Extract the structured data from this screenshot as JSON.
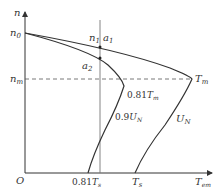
{
  "diagram": {
    "type": "motor mechanical characteristic (speed vs torque)",
    "axes": {
      "y_axis_label": "n",
      "x_axis_label": "T",
      "x_axis_label_sub": "em",
      "origin_label": "O"
    },
    "y_ticks": [
      {
        "label": "n",
        "sub": "0"
      },
      {
        "label": "n",
        "sub": "m"
      }
    ],
    "x_ticks": [
      {
        "prefix": "0.81",
        "label": "T",
        "sub": "s"
      },
      {
        "prefix": "",
        "label": "T",
        "sub": "s"
      }
    ],
    "points": [
      {
        "label": "n",
        "sub": "1"
      },
      {
        "label": "a",
        "sub": "1"
      },
      {
        "label": "a",
        "sub": "2"
      }
    ],
    "curve_labels": [
      {
        "prefix": "0.9",
        "label": "U",
        "sub": "N"
      },
      {
        "prefix": "",
        "label": "U",
        "sub": "N"
      }
    ],
    "annotations": [
      {
        "prefix": "0.81",
        "label": "T",
        "sub": "m"
      },
      {
        "prefix": "",
        "label": "T",
        "sub": "m"
      }
    ],
    "colors": {
      "curve": "#333333",
      "axis": "#333333",
      "dashed": "#555555",
      "vertical_line": "#777777"
    }
  }
}
